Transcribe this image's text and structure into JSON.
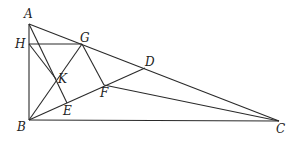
{
  "figure": {
    "points": {
      "A": {
        "label": "A",
        "x": 29,
        "y": 24,
        "lx": 24,
        "ly": 18
      },
      "H": {
        "label": "H",
        "x": 29,
        "y": 44,
        "lx": 15,
        "ly": 48
      },
      "B": {
        "label": "B",
        "x": 29,
        "y": 120,
        "lx": 17,
        "ly": 131
      },
      "G": {
        "label": "G",
        "x": 82,
        "y": 44,
        "lx": 80,
        "ly": 42
      },
      "K": {
        "label": "K",
        "x": 56,
        "y": 79,
        "lx": 58,
        "ly": 83
      },
      "E": {
        "label": "E",
        "x": 67,
        "y": 103,
        "lx": 63,
        "ly": 115
      },
      "F": {
        "label": "F",
        "x": 104,
        "y": 85,
        "lx": 100,
        "ly": 97
      },
      "D": {
        "label": "D",
        "x": 145,
        "y": 68,
        "lx": 145,
        "ly": 66
      },
      "C": {
        "label": "C",
        "x": 279,
        "y": 121,
        "lx": 276,
        "ly": 133
      }
    },
    "segments": [
      [
        "A",
        "B"
      ],
      [
        "B",
        "C"
      ],
      [
        "A",
        "C"
      ],
      [
        "H",
        "G"
      ],
      [
        "A",
        "E"
      ],
      [
        "H",
        "K"
      ],
      [
        "B",
        "G"
      ],
      [
        "G",
        "F"
      ],
      [
        "B",
        "D"
      ],
      [
        "F",
        "C"
      ]
    ],
    "stroke_color": "#2a2a2a"
  }
}
